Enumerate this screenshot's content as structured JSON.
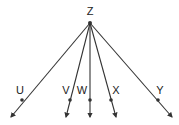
{
  "diagram": {
    "type": "rays-from-common-endpoint",
    "vertex": {
      "label": "Z",
      "x": 90,
      "y": 23,
      "label_x": 90,
      "label_y": 15
    },
    "rays": [
      {
        "label": "U",
        "point": {
          "x": 22,
          "y": 100
        },
        "end": {
          "x": 11,
          "y": 117
        },
        "label_x": 20,
        "label_y": 94
      },
      {
        "label": "V",
        "point": {
          "x": 70,
          "y": 100
        },
        "end": {
          "x": 66,
          "y": 117
        },
        "label_x": 66,
        "label_y": 94
      },
      {
        "label": "W",
        "point": {
          "x": 90,
          "y": 100
        },
        "end": {
          "x": 90,
          "y": 117
        },
        "label_x": 82,
        "label_y": 94
      },
      {
        "label": "X",
        "point": {
          "x": 111,
          "y": 100
        },
        "end": {
          "x": 116,
          "y": 117
        },
        "label_x": 116,
        "label_y": 94
      },
      {
        "label": "Y",
        "point": {
          "x": 158,
          "y": 100
        },
        "end": {
          "x": 172,
          "y": 117
        },
        "label_x": 160,
        "label_y": 94
      }
    ],
    "colors": {
      "line": "#333333",
      "text": "#222222",
      "background": "#ffffff"
    }
  }
}
